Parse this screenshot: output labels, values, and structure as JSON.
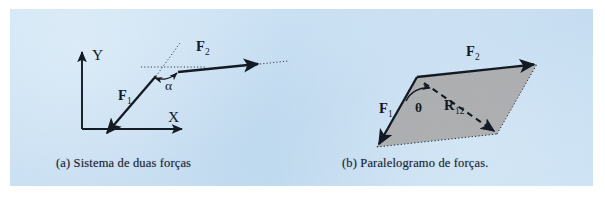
{
  "figure": {
    "background_color": "#c9e1f4",
    "page_color": "#ffffff",
    "ink_color": "#10161f",
    "parallelogram_fill": "#a9a9a9"
  },
  "panel_a": {
    "caption": "(a) Sistema de duas forças",
    "axis_y_label": "Y",
    "axis_x_label": "X",
    "vector_f1_label": "F",
    "vector_f1_sub": "1",
    "vector_f2_label": "F",
    "vector_f2_sub": "2",
    "angle_label": "α"
  },
  "panel_b": {
    "caption": "(b) Paralelogramo de forças.",
    "vector_f1_label": "F",
    "vector_f1_sub": "1",
    "vector_f2_label": "F",
    "vector_f2_sub": "2",
    "resultant_label": "R",
    "resultant_sub": "12",
    "angle_label": "θ"
  }
}
